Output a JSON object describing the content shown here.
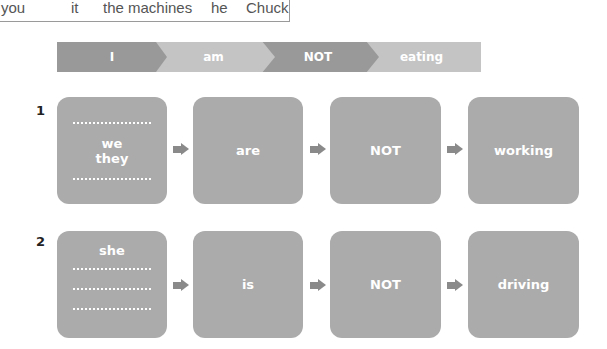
{
  "word_bank": [
    "you",
    "it",
    "the machines",
    "he",
    "Chuck"
  ],
  "example": {
    "segments": [
      "I",
      "am",
      "NOT",
      "eating"
    ]
  },
  "exercises": [
    {
      "number": "1",
      "subject_lines": [
        "we",
        "they"
      ],
      "verb": "are",
      "negation": "NOT",
      "gerund": "working"
    },
    {
      "number": "2",
      "subject_lines": [
        "she"
      ],
      "verb": "is",
      "negation": "NOT",
      "gerund": "driving"
    }
  ],
  "colors": {
    "box": "#ababab",
    "banner_dark": "#999999",
    "banner_light": "#c4c4c4",
    "arrow": "#8a8a8a"
  }
}
